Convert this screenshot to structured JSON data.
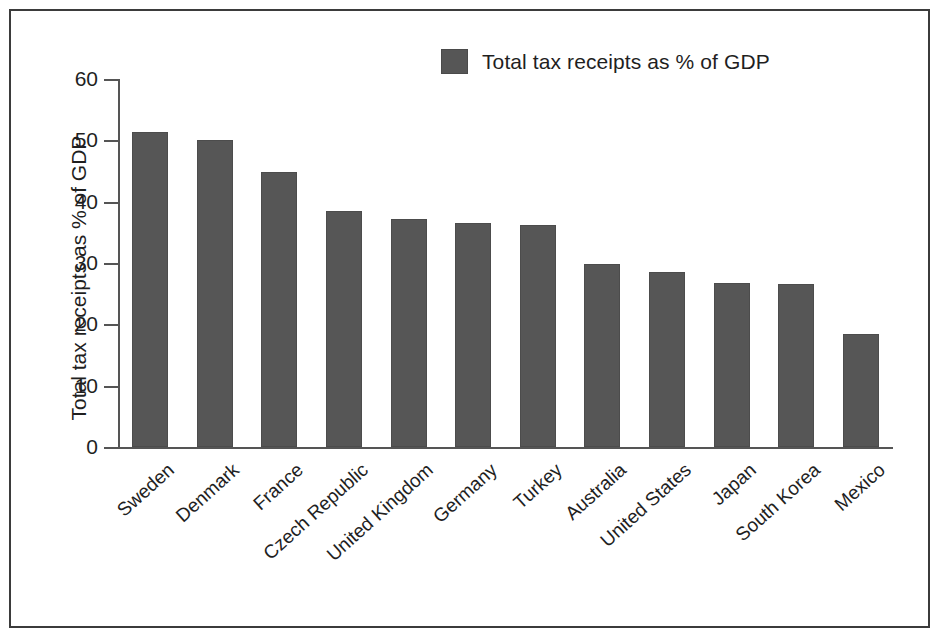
{
  "chart_data": {
    "type": "bar",
    "title": "",
    "subtitle": "",
    "xlabel": "",
    "ylabel": "Total tax receipts as % of GDP",
    "legend": [
      {
        "name": "Total tax receipts as % of GDP",
        "color": "#565656"
      }
    ],
    "legend_position": "top-center",
    "grid": false,
    "ylim": [
      0,
      60
    ],
    "ytick_labels": [
      "0",
      "10",
      "20",
      "30",
      "40",
      "50",
      "60"
    ],
    "ytick_values": [
      0,
      10,
      20,
      30,
      40,
      50,
      60
    ],
    "categories": [
      "Sweden",
      "Denmark",
      "France",
      "Czech Republic",
      "United Kingdom",
      "Germany",
      "Turkey",
      "Australia",
      "United States",
      "Japan",
      "South Korea",
      "Mexico"
    ],
    "series": [
      {
        "name": "Total tax receipts as % of GDP",
        "color": "#565656",
        "values": [
          51.4,
          50.0,
          44.9,
          38.4,
          37.1,
          36.5,
          36.2,
          29.8,
          28.5,
          26.8,
          26.6,
          18.4
        ]
      }
    ]
  },
  "figure": {
    "border_color": "#3b3b3b",
    "background": "#ffffff",
    "axis_color": "#555555",
    "bar_color": "#565656"
  }
}
